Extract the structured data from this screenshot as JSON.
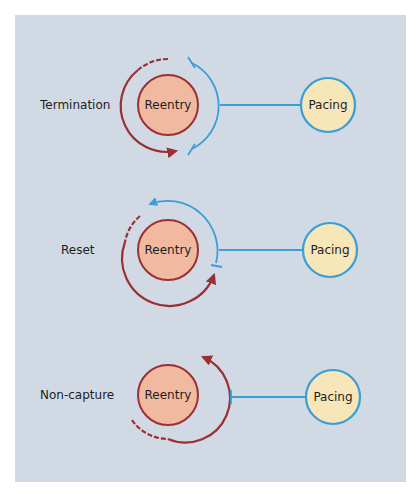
{
  "colors": {
    "background": "#d0d9e4",
    "reentry_fill": "#f0b9a0",
    "reentry_stroke": "#9b2f33",
    "pacing_fill": "#f6e6b8",
    "pacing_stroke": "#3a9fd6",
    "red_arc": "#9b2f33",
    "blue_arc": "#3a9fd6"
  },
  "sections": [
    {
      "label": "Termination",
      "reentry_label": "Reentry",
      "pacing_label": "Pacing",
      "description": "Pacing wavefront collides with reentrant wavefront; both blocked, reentry terminated"
    },
    {
      "label": "Reset",
      "reentry_label": "Reentry",
      "pacing_label": "Pacing",
      "description": "Pacing wavefront enters circuit and advances reentrant wavefront"
    },
    {
      "label": "Non-capture",
      "reentry_label": "Reentry",
      "pacing_label": "Pacing",
      "description": "Pacing wavefront blocked before reaching circuit; reentry continues"
    }
  ]
}
